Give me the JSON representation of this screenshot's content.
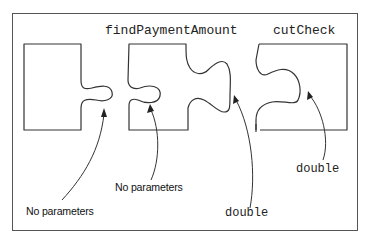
{
  "diagram": {
    "type": "puzzle-piece method call illustration",
    "pieces": [
      {
        "id": "first",
        "title": "",
        "description": "left piece with a connector knob on its right side"
      },
      {
        "id": "findPaymentAmount",
        "title": "findPaymentAmount",
        "description": "middle piece with a notch on its left side and a knob on its right side"
      },
      {
        "id": "cutCheck",
        "title": "cutCheck",
        "description": "right piece with a notch on its left side"
      }
    ],
    "annotations": [
      {
        "id": "ann-1",
        "text": "No parameters",
        "style": "sans",
        "points_to": "knob of the first piece"
      },
      {
        "id": "ann-2",
        "text": "No parameters",
        "style": "sans",
        "points_to": "notch of findPaymentAmount"
      },
      {
        "id": "ann-3",
        "text": "double",
        "style": "mono",
        "points_to": "knob of findPaymentAmount"
      },
      {
        "id": "ann-4",
        "text": "double",
        "style": "mono",
        "points_to": "notch of cutCheck"
      }
    ],
    "colors": {
      "stroke": "#333333",
      "frame": "#555555",
      "text": "#222222",
      "background": "#ffffff"
    }
  }
}
